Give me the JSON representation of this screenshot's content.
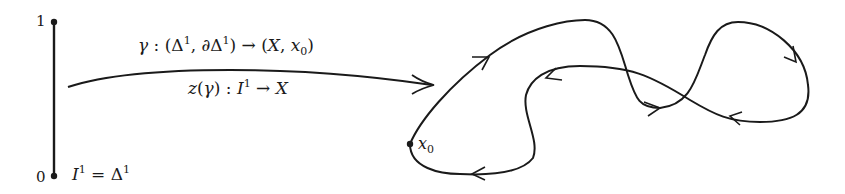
{
  "diagram": {
    "interval": {
      "top_label": "1",
      "bottom_label": "0",
      "caption_lhs": "I",
      "caption_lhs_sup": "1",
      "caption_eq": " = Δ",
      "caption_rhs_sup": "1"
    },
    "arrow": {
      "top_label_parts": {
        "gamma": "γ",
        "rest": " : (Δ",
        "sup1": "1",
        "mid": ", ∂Δ",
        "sup2": "1",
        "tail": ") → (",
        "X": "X",
        "comma": ", ",
        "x": "x",
        "sub": "0",
        "close": ")"
      },
      "bottom_label_parts": {
        "z": "z",
        "open": "(",
        "gamma": "γ",
        "close": ") : ",
        "I": "I",
        "sup": "1",
        "to": " → ",
        "X": "X"
      }
    },
    "loop": {
      "basepoint_label": "x",
      "basepoint_sub": "0"
    },
    "stroke_color": "#1a1a1a"
  }
}
